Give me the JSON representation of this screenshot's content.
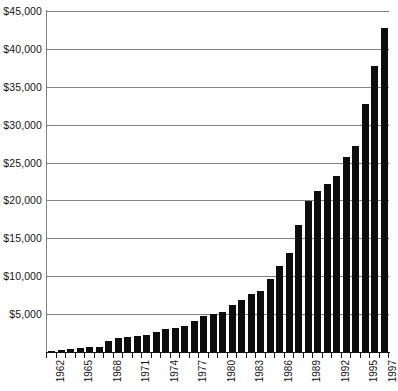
{
  "chart_data": {
    "type": "bar",
    "title": "",
    "subtitle": "",
    "xlabel": "",
    "ylabel": "",
    "grid": true,
    "legend": null,
    "legend_position": "none",
    "bar_color": "#0d0d0d",
    "grid_color": "#818181",
    "axis_color": "#151515",
    "ylim": [
      0,
      45000
    ],
    "ytick_labels": [
      "$45,000",
      "$40,000",
      "$35,000",
      "$30,000",
      "$25,000",
      "$20,000",
      "$15,000",
      "$10,000",
      "$5,000"
    ],
    "ytick_values": [
      45000,
      40000,
      35000,
      30000,
      25000,
      20000,
      15000,
      10000,
      5000
    ],
    "xtick_labels": [
      "1962",
      "1965",
      "1968",
      "1971",
      "1974",
      "1977",
      "1980",
      "1983",
      "1986",
      "1989",
      "1992",
      "1995",
      "1997"
    ],
    "categories": [
      "1962",
      "1963",
      "1964",
      "1965",
      "1966",
      "1967",
      "1968",
      "1969",
      "1970",
      "1971",
      "1972",
      "1973",
      "1974",
      "1975",
      "1976",
      "1977",
      "1978",
      "1979",
      "1980",
      "1981",
      "1982",
      "1983",
      "1984",
      "1985",
      "1986",
      "1987",
      "1988",
      "1989",
      "1990",
      "1991",
      "1992",
      "1993",
      "1994",
      "1995",
      "1996",
      "1997"
    ],
    "values": [
      200,
      300,
      400,
      500,
      600,
      700,
      1500,
      1900,
      2000,
      2100,
      2200,
      2600,
      3100,
      3200,
      3400,
      4100,
      4700,
      5000,
      5300,
      6200,
      6900,
      7600,
      8000,
      9700,
      11300,
      13100,
      16700,
      19900,
      21200,
      22200,
      23200,
      25800,
      27200,
      32700,
      37800,
      42800
    ]
  }
}
